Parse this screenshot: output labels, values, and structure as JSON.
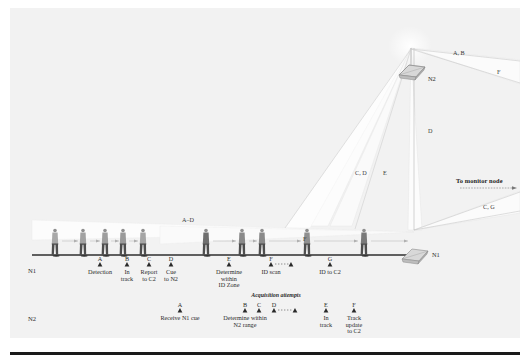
{
  "figure": {
    "background_color": "#f2f2f2",
    "ink_color": "#2a2a2a",
    "beam_fill": "#fbfbfb"
  },
  "nodes": {
    "n1_label": "N1",
    "n2_label": "N2",
    "monitor_label": "To monitor node"
  },
  "beam_labels": [
    {
      "text": "A, B",
      "x": 443,
      "y": 42
    },
    {
      "text": "F",
      "x": 487,
      "y": 61
    },
    {
      "text": "D",
      "x": 418,
      "y": 120
    },
    {
      "text": "C, D",
      "x": 345,
      "y": 162
    },
    {
      "text": "E",
      "x": 373,
      "y": 162
    },
    {
      "text": "C, G",
      "x": 473,
      "y": 196
    },
    {
      "text": "A–D",
      "x": 172,
      "y": 209
    },
    {
      "text": "F",
      "x": 293,
      "y": 228
    }
  ],
  "swimlanes": {
    "n1": {
      "name": "N1",
      "label_x": 22,
      "label_y": 263,
      "events": [
        {
          "letter": "A",
          "lines": [
            "Detection"
          ],
          "x": 90
        },
        {
          "letter": "B",
          "lines": [
            "In",
            "track"
          ],
          "x": 117
        },
        {
          "letter": "C",
          "lines": [
            "Report",
            "to C2"
          ],
          "x": 139
        },
        {
          "letter": "D",
          "lines": [
            "Cue",
            "to N2"
          ],
          "x": 161
        },
        {
          "letter": "E",
          "lines": [
            "Determine",
            "within",
            "ID Zone"
          ],
          "x": 219
        },
        {
          "letter": "F",
          "lines": [
            "ID scan"
          ],
          "x": 261
        },
        {
          "letter": "",
          "lines": [],
          "x": 281
        },
        {
          "letter": "G",
          "lines": [
            "ID to C2"
          ],
          "x": 320
        }
      ]
    },
    "n2": {
      "name": "N2",
      "label_x": 22,
      "label_y": 311,
      "acquisition_label": "Acquisition attempts",
      "events": [
        {
          "letter": "A",
          "lines": [
            "Receive N1 cue"
          ],
          "x": 170
        },
        {
          "letter": "B",
          "lines": [
            "Determine within",
            "N2 range"
          ],
          "x": 235
        },
        {
          "letter": "C",
          "lines": [],
          "x": 249
        },
        {
          "letter": "D",
          "lines": [],
          "x": 264
        },
        {
          "letter": "",
          "lines": [],
          "x": 285
        },
        {
          "letter": "E",
          "lines": [
            "In",
            "track"
          ],
          "x": 316
        },
        {
          "letter": "F",
          "lines": [
            "Track",
            "update",
            "to C2"
          ],
          "x": 344
        }
      ]
    }
  },
  "walkers": {
    "count": 10,
    "x_positions": [
      45,
      73,
      95,
      113,
      133,
      196,
      232,
      252,
      297,
      354
    ],
    "ground_y": 248
  }
}
